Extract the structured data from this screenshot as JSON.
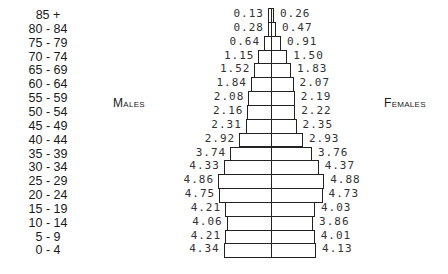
{
  "chart_data": {
    "type": "bar",
    "subtype": "population-pyramid",
    "title": "",
    "xlabel": "",
    "ylabel": "",
    "unit": "percent of population",
    "left_label": "Males",
    "right_label": "Females",
    "categories": [
      "85 +",
      "80 - 84",
      "75 - 79",
      "70 - 74",
      "65 - 69",
      "60 - 64",
      "55 - 59",
      "50 - 54",
      "45 - 49",
      "40 - 44",
      "35 - 39",
      "30 - 34",
      "25 - 29",
      "20 - 24",
      "15 - 19",
      "10 - 14",
      "5 - 9",
      "0 - 4"
    ],
    "series": [
      {
        "name": "Males",
        "side": "left",
        "values": [
          0.13,
          0.28,
          0.64,
          1.15,
          1.52,
          1.84,
          2.08,
          2.16,
          2.31,
          2.92,
          3.74,
          4.33,
          4.86,
          4.75,
          4.21,
          4.06,
          4.21,
          4.34
        ]
      },
      {
        "name": "Females",
        "side": "right",
        "values": [
          0.26,
          0.47,
          0.91,
          1.5,
          1.83,
          2.07,
          2.19,
          2.22,
          2.35,
          2.93,
          3.76,
          4.37,
          4.88,
          4.73,
          4.03,
          3.86,
          4.01,
          4.13
        ]
      }
    ],
    "value_labels": {
      "males": [
        "0.13",
        "0.28",
        "0.64",
        "1.15",
        "1.52",
        "1.84",
        "2.08",
        "2.16",
        "2.31",
        "2.92",
        "3.74",
        "4.33",
        "4.86",
        "4.75",
        "4.21",
        "4.06",
        "4.21",
        "4.34"
      ],
      "females": [
        "0.26",
        "0.47",
        "0.91",
        "1.50",
        "1.83",
        "2.07",
        "2.19",
        "2.22",
        "2.35",
        "2.93",
        "3.76",
        "4.37",
        "4.88",
        "4.73",
        "4.03",
        "3.86",
        "4.01",
        "4.13"
      ]
    },
    "grid": false,
    "legend": "none",
    "colors": {
      "bar_fill": "#ffffff",
      "bar_stroke": "#222222"
    }
  }
}
